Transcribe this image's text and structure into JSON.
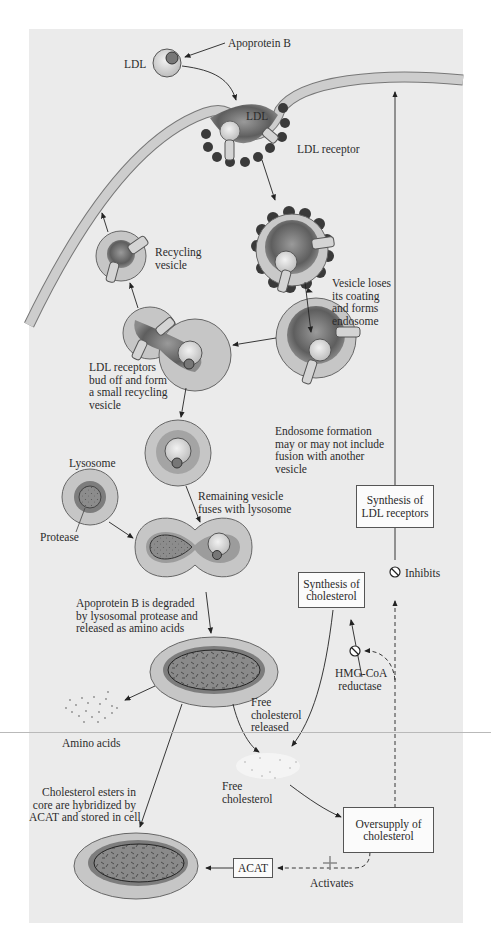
{
  "labels": {
    "apoprotein_b": "Apoprotein B",
    "ldl_particle": "LDL",
    "ldl_pit": "LDL",
    "ldl_receptor": "LDL receptor",
    "recycling_vesicle": [
      "Recycling",
      "vesicle"
    ],
    "vesicle_loses_coating": [
      "Vesicle loses",
      "its coating",
      "and forms",
      "endosome"
    ],
    "receptors_bud_off": [
      "LDL receptors",
      "bud off and form",
      "a small recycling",
      "vesicle"
    ],
    "endosome_formation": [
      "Endosome formation",
      "may or may not include",
      "fusion with another",
      "vesicle"
    ],
    "lysosome": "Lysosome",
    "protease": "Protease",
    "remaining_vesicle": [
      "Remaining vesicle",
      "fuses with lysosome"
    ],
    "apoprotein_degraded": [
      "Apoprotein B is degraded",
      "by  lysosomal protease and",
      "released as amino acids"
    ],
    "amino_acids": "Amino acids",
    "free_cholesterol_released": [
      "Free",
      "cholesterol",
      "released"
    ],
    "free_cholesterol": [
      "Free",
      "cholesterol"
    ],
    "cholesterol_esters": [
      "Cholesterol esters in",
      "core are hybridized by",
      "ACAT and stored in cell"
    ],
    "hmg_coa": [
      "HMG-CoA",
      "reductase"
    ],
    "inhibits": "Inhibits",
    "activates": "Activates"
  },
  "boxes": {
    "synthesis_ldl_receptors": [
      "Synthesis of",
      "LDL receptors"
    ],
    "synthesis_cholesterol": [
      "Synthesis of",
      "cholesterol"
    ],
    "oversupply_cholesterol": [
      "Oversupply of",
      "cholesterol"
    ],
    "acat": "ACAT"
  },
  "colors": {
    "panel_bg": "#ebebeb",
    "membrane": "#c9c9c9",
    "vesicle_outer": "#c4c4c4",
    "vesicle_inner": "#6e6e6e",
    "clathrin": "#3a3a3a",
    "receptor": "#d2d2d2"
  }
}
